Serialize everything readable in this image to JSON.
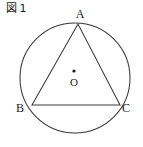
{
  "figure": {
    "caption_prefix": "図",
    "caption_number": "1",
    "caption_full": "図 1"
  },
  "diagram": {
    "type": "circle-with-inscribed-triangle",
    "stroke_color": "#3a3a3a",
    "label_color": "#1a1a1a",
    "background_color": "#ffffff",
    "circle": {
      "center_label": "O",
      "cx": 75,
      "cy": 78,
      "r": 55
    },
    "center_point": {
      "label": "O",
      "dot_x": 74,
      "dot_y": 71,
      "dot_r": 1.6,
      "label_x": 74,
      "label_y": 86
    },
    "vertices": [
      {
        "label": "A",
        "x": 78,
        "y": 24,
        "label_x": 80,
        "label_y": 18
      },
      {
        "label": "B",
        "x": 32,
        "y": 105,
        "label_x": 20,
        "label_y": 112
      },
      {
        "label": "C",
        "x": 120,
        "y": 105,
        "label_x": 126,
        "label_y": 112
      }
    ],
    "edges": [
      {
        "name": "AB",
        "from": "A",
        "to": "B"
      },
      {
        "name": "BC",
        "from": "B",
        "to": "C"
      },
      {
        "name": "CA",
        "from": "C",
        "to": "A"
      }
    ],
    "triangle_points": "78,24 32,105 120,105"
  }
}
